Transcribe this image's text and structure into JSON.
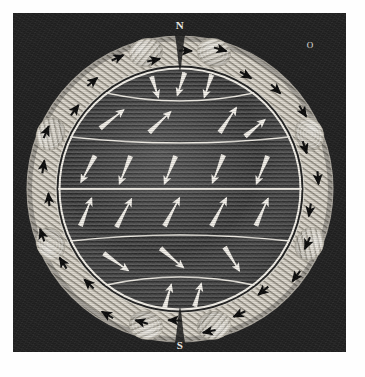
{
  "figure": {
    "kind": "engraved-plate",
    "title": "Terrestrial globe encircled by a toroidal magnetic ring",
    "plate": {
      "x": 13,
      "y": 13,
      "width": 333,
      "height": 339,
      "background": "#232323"
    },
    "paper_color": "#fefefe",
    "ink_light": "#efece5",
    "ink_dark": "#141414"
  },
  "globe": {
    "cx": 180,
    "cy": 189,
    "r": 122,
    "rim_color": "#f4f1ea",
    "body_color": "#4a4a4a",
    "hatch": "horizontal-line-shading",
    "latitudes": [
      {
        "name": "arctic-circle",
        "y_offset": -96,
        "bow": 16
      },
      {
        "name": "tropic-of-cancer",
        "y_offset": -52,
        "bow": 12
      },
      {
        "name": "equator",
        "y_offset": 0,
        "bow": 0
      },
      {
        "name": "tropic-of-capricorn",
        "y_offset": 52,
        "bow": -12
      },
      {
        "name": "antarctic-circle",
        "y_offset": 96,
        "bow": -16
      }
    ]
  },
  "labels": {
    "north_pole": "N",
    "south_pole": "S",
    "corner_mark": "O"
  },
  "field_arrows": {
    "color": "#f5f2ec",
    "description": "white dipole-field arrows on the globe face",
    "count": 30,
    "items": [
      {
        "x": 181,
        "y": 84,
        "angle": 108,
        "len": 24
      },
      {
        "x": 208,
        "y": 86,
        "angle": 108,
        "len": 24
      },
      {
        "x": 155,
        "y": 87,
        "angle": 72,
        "len": 22
      },
      {
        "x": 112,
        "y": 119,
        "angle": -38,
        "len": 30
      },
      {
        "x": 160,
        "y": 122,
        "angle": -44,
        "len": 30
      },
      {
        "x": 228,
        "y": 120,
        "angle": -56,
        "len": 30
      },
      {
        "x": 255,
        "y": 128,
        "angle": -40,
        "len": 26
      },
      {
        "x": 88,
        "y": 169,
        "angle": 118,
        "len": 30
      },
      {
        "x": 125,
        "y": 170,
        "angle": 112,
        "len": 30
      },
      {
        "x": 170,
        "y": 170,
        "angle": 112,
        "len": 30
      },
      {
        "x": 218,
        "y": 169,
        "angle": 112,
        "len": 30
      },
      {
        "x": 262,
        "y": 170,
        "angle": 112,
        "len": 30
      },
      {
        "x": 86,
        "y": 212,
        "angle": -68,
        "len": 30
      },
      {
        "x": 124,
        "y": 213,
        "angle": -62,
        "len": 32
      },
      {
        "x": 172,
        "y": 212,
        "angle": -62,
        "len": 32
      },
      {
        "x": 219,
        "y": 212,
        "angle": -62,
        "len": 32
      },
      {
        "x": 262,
        "y": 212,
        "angle": -66,
        "len": 30
      },
      {
        "x": 116,
        "y": 262,
        "angle": 35,
        "len": 30
      },
      {
        "x": 172,
        "y": 258,
        "angle": 40,
        "len": 30
      },
      {
        "x": 232,
        "y": 259,
        "angle": 58,
        "len": 28
      },
      {
        "x": 168,
        "y": 296,
        "angle": -74,
        "len": 24
      },
      {
        "x": 198,
        "y": 295,
        "angle": -74,
        "len": 24
      }
    ]
  },
  "ring": {
    "name": "toroidal magnet ring",
    "inner_radius": 126,
    "outer_radius": 155,
    "fill": "#ded9cf",
    "lobe_count": 8,
    "lobes": [
      {
        "name": "lobe-n-left",
        "angle": -104
      },
      {
        "name": "lobe-n-right",
        "angle": -76
      },
      {
        "name": "lobe-e-upper",
        "angle": -23
      },
      {
        "name": "lobe-e-lower",
        "angle": 23
      },
      {
        "name": "lobe-s-right",
        "angle": 76
      },
      {
        "name": "lobe-s-left",
        "angle": 104
      },
      {
        "name": "lobe-w-lower",
        "angle": 157
      },
      {
        "name": "lobe-w-upper",
        "angle": 203
      }
    ],
    "current_arrows": {
      "color": "#111111",
      "description": "small black arrows indicating current circulation in the ring",
      "count": 26
    }
  },
  "caption": ""
}
